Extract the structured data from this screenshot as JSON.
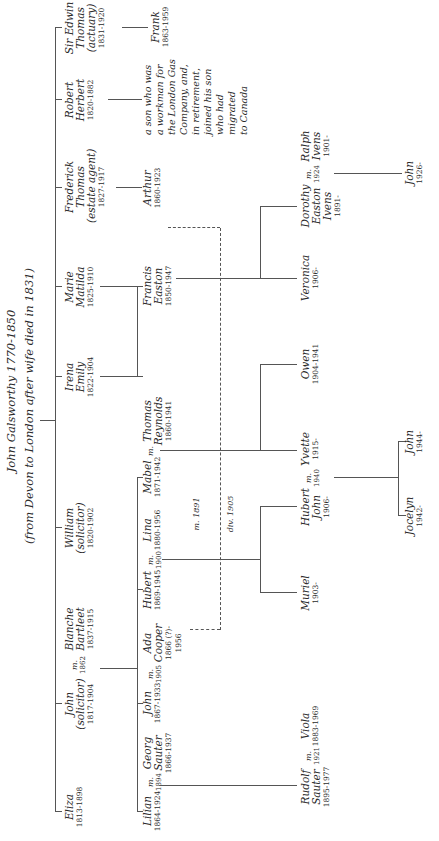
{
  "title": {
    "line1": "John Galsworthy 1770-1850",
    "line2": "(from Devon to London after wife died in 1831)"
  },
  "generation2": [
    {
      "id": "eliza",
      "names": [
        "Eliza"
      ],
      "dates": "1813-1898"
    },
    {
      "id": "john",
      "names": [
        "John",
        "(solicitor)"
      ],
      "dates": "1817-1904"
    },
    {
      "id": "blanche",
      "names": [
        "Blanche",
        "Bartleet"
      ],
      "dates": "1837-1915"
    },
    {
      "id": "william",
      "names": [
        "William",
        "(solicitor)"
      ],
      "dates": "1820-1902"
    },
    {
      "id": "irena",
      "names": [
        "Irena",
        "Emily"
      ],
      "dates": "1822-1904"
    },
    {
      "id": "marie",
      "names": [
        "Marie",
        "Matilda"
      ],
      "dates": "1825-1910"
    },
    {
      "id": "frederick",
      "names": [
        "Frederick",
        "Thomas",
        "(estate agent)"
      ],
      "dates": "1827-1917"
    },
    {
      "id": "robert",
      "names": [
        "Robert",
        "Herbert"
      ],
      "dates": "1820-1882"
    },
    {
      "id": "edwin",
      "names": [
        "Sir Edwin",
        "Thomas",
        "(actuary)"
      ],
      "dates": "1831-1920"
    }
  ],
  "generation3": [
    {
      "id": "lilian",
      "names": [
        "Lilian"
      ],
      "dates": "1864-1924"
    },
    {
      "id": "georg",
      "names": [
        "Georg",
        "Sauter"
      ],
      "dates": "1866-1937"
    },
    {
      "id": "john2",
      "names": [
        "John"
      ],
      "dates": "1867-1933"
    },
    {
      "id": "ada",
      "names": [
        "Ada",
        "Cooper"
      ],
      "dates": "1866 (?)-",
      "dates2": "1956"
    },
    {
      "id": "hubert",
      "names": [
        "Hubert"
      ],
      "dates": "1869-1945"
    },
    {
      "id": "lina",
      "names": [
        "Lina"
      ],
      "dates": "1880-1956"
    },
    {
      "id": "mabel",
      "names": [
        "Mabel"
      ],
      "dates": "1871-1942"
    },
    {
      "id": "thomas",
      "names": [
        "Thomas",
        "Reynolds"
      ],
      "dates": "1860-1941"
    },
    {
      "id": "francis",
      "names": [
        "Francis",
        "Easton"
      ],
      "dates": "1850-1947"
    },
    {
      "id": "arthur",
      "names": [
        "Arthur"
      ],
      "dates": "1860-1923"
    },
    {
      "id": "frank",
      "names": [
        "Frank"
      ],
      "dates": "1863-1959"
    }
  ],
  "generation4": [
    {
      "id": "rudolf",
      "names": [
        "Rudolf",
        "Sauter"
      ],
      "dates": "1895-1977"
    },
    {
      "id": "viola",
      "names": [
        "Viola"
      ],
      "dates": "1883-1969"
    },
    {
      "id": "muriel",
      "names": [
        "Muriel"
      ],
      "dates": "1903-"
    },
    {
      "id": "hubertjohn",
      "names": [
        "Hubert",
        "John"
      ],
      "dates": "1906-"
    },
    {
      "id": "yvette",
      "names": [
        "Yvette"
      ],
      "dates": "1915-"
    },
    {
      "id": "owen",
      "names": [
        "Owen"
      ],
      "dates": "1904-1941"
    },
    {
      "id": "veronica",
      "names": [
        "Veronica"
      ],
      "dates": "1906-"
    },
    {
      "id": "dorothy",
      "names": [
        "Dorothy",
        "Easton",
        "Ivens"
      ],
      "dates": "1891-"
    },
    {
      "id": "ralph",
      "names": [
        "Ralph",
        "Ivens"
      ],
      "dates": "1901-"
    }
  ],
  "generation5": [
    {
      "id": "jocelyn",
      "names": [
        "Jocelyn"
      ],
      "dates": "1942-"
    },
    {
      "id": "john3",
      "names": [
        "John"
      ],
      "dates": "1944-"
    },
    {
      "id": "john4",
      "names": [
        "John"
      ],
      "dates": "1926-"
    }
  ],
  "marriages": {
    "john_blanche": {
      "m": "m.",
      "year": "1862"
    },
    "lilian_georg": {
      "m": "m.",
      "year": "1894"
    },
    "john_ada": {
      "m": "m.",
      "year": "1905"
    },
    "hubert_lina": {
      "m": "m.",
      "year": "1900"
    },
    "mabel_thomas": {
      "m": "m.",
      "year": ""
    },
    "arthur_ada": {
      "m": "m. 1891",
      "div": "div. 1905"
    },
    "rudolf_viola": {
      "m": "m.",
      "year": "1921"
    },
    "hubertjohn_yvette": {
      "m": "m.",
      "year": "1940"
    },
    "dorothy_ralph": {
      "m": "m.",
      "year": "1924"
    }
  },
  "note": [
    "a son who was",
    "a workman for",
    "the London Gas",
    "Company, and,",
    "in retirement,",
    "joined his son",
    "who had migrated",
    "to Canada"
  ]
}
